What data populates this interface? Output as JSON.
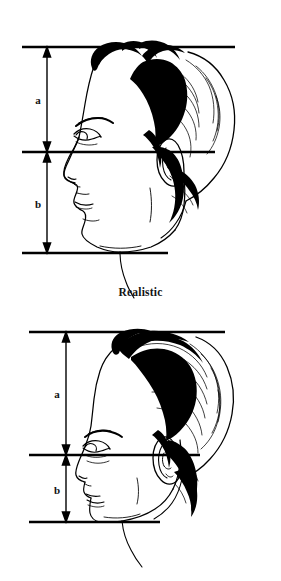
{
  "document": {
    "type": "illustration-plate",
    "background_color": "#ffffff",
    "ink_color": "#000000",
    "width": 281,
    "height": 581,
    "description": "Two side-profile male head drawings with horizontal measurement rules and vertical double-headed dimension arrows labelled a and b, comparing realistic versus idealistic head proportions."
  },
  "figures": [
    {
      "id": "realistic",
      "caption": "Realistic",
      "caption_y": 286,
      "subject": "man-head-profile-left",
      "rules": [
        {
          "name": "top-of-head-rule",
          "y": 47,
          "x1": 22,
          "x2": 235
        },
        {
          "name": "eye-line-rule",
          "y": 152,
          "x1": 22,
          "x2": 215
        },
        {
          "name": "chin-line-rule",
          "y": 253,
          "x1": 22,
          "x2": 168
        }
      ],
      "dimensions": [
        {
          "label": "a",
          "from_y": 47,
          "to_y": 152,
          "x": 47,
          "label_x": 38,
          "label_y": 104,
          "span": "top of head to eye line"
        },
        {
          "label": "b",
          "from_y": 152,
          "to_y": 253,
          "x": 47,
          "label_x": 38,
          "label_y": 208,
          "span": "eye line to chin"
        }
      ]
    },
    {
      "id": "idealistic",
      "caption": "Idealistic",
      "caption_y": 558,
      "subject": "man-head-profile-left",
      "rules": [
        {
          "name": "top-of-head-rule",
          "y": 332,
          "x1": 29,
          "x2": 225
        },
        {
          "name": "eye-line-rule",
          "y": 455,
          "x1": 29,
          "x2": 200
        },
        {
          "name": "chin-line-rule",
          "y": 522,
          "x1": 29,
          "x2": 160
        }
      ],
      "dimensions": [
        {
          "label": "a",
          "from_y": 332,
          "to_y": 455,
          "x": 66,
          "label_x": 57,
          "label_y": 398,
          "span": "top of head to eye line"
        },
        {
          "label": "b",
          "from_y": 455,
          "to_y": 522,
          "x": 66,
          "label_x": 57,
          "label_y": 494,
          "span": "eye line to chin"
        }
      ]
    }
  ]
}
